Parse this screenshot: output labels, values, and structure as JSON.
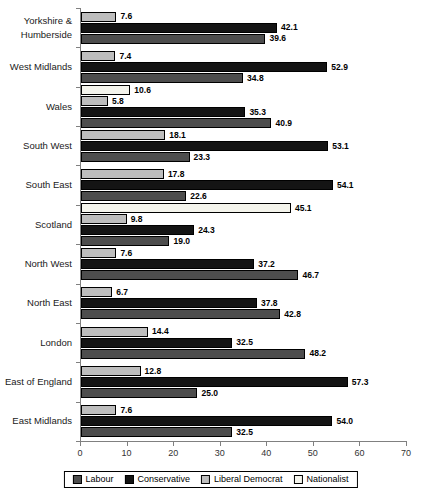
{
  "chart_data": {
    "type": "bar",
    "orientation": "horizontal",
    "title": "",
    "xlabel": "",
    "ylabel": "",
    "xlim": [
      0,
      70
    ],
    "xticks": [
      0,
      10,
      20,
      30,
      40,
      50,
      60,
      70
    ],
    "grid": false,
    "legend_position": "bottom",
    "value_label_format": "one_decimal",
    "bar_order_top_to_bottom": [
      "Nationalist",
      "Liberal Democrat",
      "Conservative",
      "Labour"
    ],
    "categories": [
      "Yorkshire & Humberside",
      "West Midlands",
      "Wales",
      "South West",
      "South East",
      "Scotland",
      "North West",
      "North East",
      "London",
      "East of England",
      "East Midlands"
    ],
    "series": [
      {
        "name": "Labour",
        "color": "#4d4d4d",
        "values": [
          39.6,
          34.8,
          40.9,
          23.3,
          22.6,
          19.0,
          46.7,
          42.8,
          48.2,
          25.0,
          32.5
        ]
      },
      {
        "name": "Conservative",
        "color": "#141414",
        "values": [
          42.1,
          52.9,
          35.3,
          53.1,
          54.1,
          24.3,
          37.2,
          37.8,
          32.5,
          57.3,
          54.0
        ]
      },
      {
        "name": "Liberal Democrat",
        "color": "#bdbdbd",
        "values": [
          7.6,
          7.4,
          5.8,
          18.1,
          17.8,
          9.8,
          7.6,
          6.7,
          14.4,
          12.8,
          7.6
        ]
      },
      {
        "name": "Nationalist",
        "color": "#f4f4ec",
        "values": [
          null,
          null,
          10.6,
          null,
          null,
          45.1,
          null,
          null,
          null,
          null,
          null
        ]
      }
    ],
    "colors": {
      "axis": "#808080",
      "bar_border": "#000000",
      "value_label": "#000000"
    }
  }
}
